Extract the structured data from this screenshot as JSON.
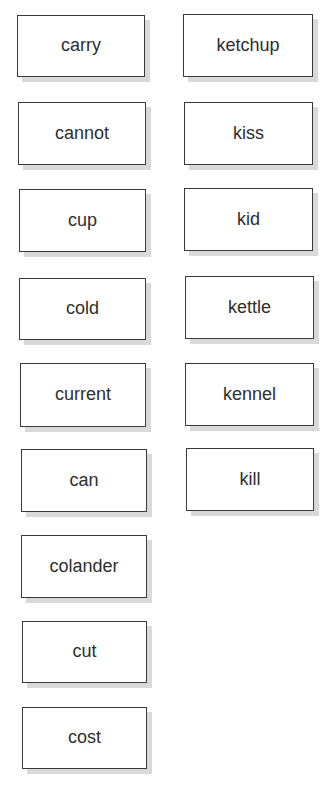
{
  "columns": [
    {
      "name": "c-words",
      "cards": [
        {
          "label": "carry",
          "x": 17,
          "y": 15,
          "w": 128,
          "h": 62
        },
        {
          "label": "cannot",
          "x": 18,
          "y": 102,
          "w": 128,
          "h": 63
        },
        {
          "label": "cup",
          "x": 19,
          "y": 189,
          "w": 127,
          "h": 63
        },
        {
          "label": "cold",
          "x": 19,
          "y": 278,
          "w": 127,
          "h": 62
        },
        {
          "label": "current",
          "x": 20,
          "y": 363,
          "w": 126,
          "h": 64
        },
        {
          "label": "can",
          "x": 21,
          "y": 449,
          "w": 126,
          "h": 63
        },
        {
          "label": "colander",
          "x": 21,
          "y": 535,
          "w": 126,
          "h": 63
        },
        {
          "label": "cut",
          "x": 22,
          "y": 621,
          "w": 125,
          "h": 62
        },
        {
          "label": "cost",
          "x": 22,
          "y": 707,
          "w": 125,
          "h": 62
        }
      ]
    },
    {
      "name": "k-words",
      "cards": [
        {
          "label": "ketchup",
          "x": 183,
          "y": 14,
          "w": 130,
          "h": 63
        },
        {
          "label": "kiss",
          "x": 184,
          "y": 102,
          "w": 129,
          "h": 63
        },
        {
          "label": "kid",
          "x": 184,
          "y": 188,
          "w": 129,
          "h": 63
        },
        {
          "label": "kettle",
          "x": 185,
          "y": 276,
          "w": 129,
          "h": 63
        },
        {
          "label": "kennel",
          "x": 185,
          "y": 363,
          "w": 129,
          "h": 63
        },
        {
          "label": "kill",
          "x": 186,
          "y": 448,
          "w": 128,
          "h": 63
        }
      ]
    }
  ]
}
